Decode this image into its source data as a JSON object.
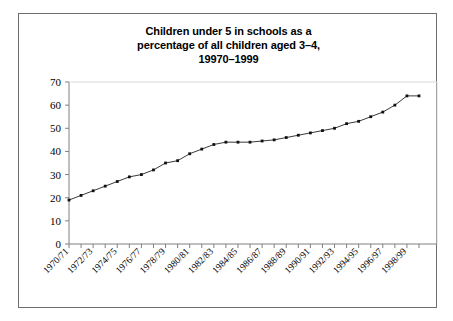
{
  "chart_data": {
    "type": "line",
    "title": "Children under 5 in schools as a percentage of all children aged 3–4, 19970–1999",
    "title_lines": [
      "Children under 5 in schools as a",
      "percentage of all children aged 3–4,",
      "19970–1999"
    ],
    "xlabel": "",
    "ylabel": "",
    "ylim": [
      0,
      70
    ],
    "ytick_values": [
      0,
      10,
      20,
      30,
      40,
      50,
      60,
      70
    ],
    "ytick_labels": [
      "0",
      "10",
      "20",
      "30",
      "40",
      "50",
      "60",
      "70"
    ],
    "grid": false,
    "legend": false,
    "legend_position": "none",
    "marker": "square",
    "line_color": "#3a3a3a",
    "marker_color": "#111111",
    "axis_color": "#808080",
    "frame_color": "#6e6e6e",
    "background_color": "#ffffff",
    "categories": [
      "1970/71",
      "1971/72",
      "1972/73",
      "1973/74",
      "1974/75",
      "1975/76",
      "1976/77",
      "1977/78",
      "1978/79",
      "1979/80",
      "1980/81",
      "1981/82",
      "1982/83",
      "1983/84",
      "1984/85",
      "1985/86",
      "1986/87",
      "1987/88",
      "1988/89",
      "1989/90",
      "1990/91",
      "1991/92",
      "1992/93",
      "1993/94",
      "1994/95",
      "1995/96",
      "1996/97",
      "1997/98",
      "1998/99",
      "1999/00"
    ],
    "xtick_labels_shown": [
      "1970/71",
      "1972/73",
      "1974/75",
      "1976/77",
      "1978/79",
      "1980/81",
      "1982/83",
      "1984/85",
      "1986/87",
      "1988/89",
      "1990/91",
      "1992/93",
      "1994/95",
      "1996/97",
      "1998/99"
    ],
    "values": [
      19,
      21,
      23,
      25,
      27,
      29,
      30,
      32,
      35,
      36,
      39,
      41,
      43,
      44,
      44,
      44,
      44.5,
      45,
      46,
      47,
      48,
      49,
      50,
      52,
      53,
      55,
      57,
      60,
      64,
      64
    ]
  }
}
